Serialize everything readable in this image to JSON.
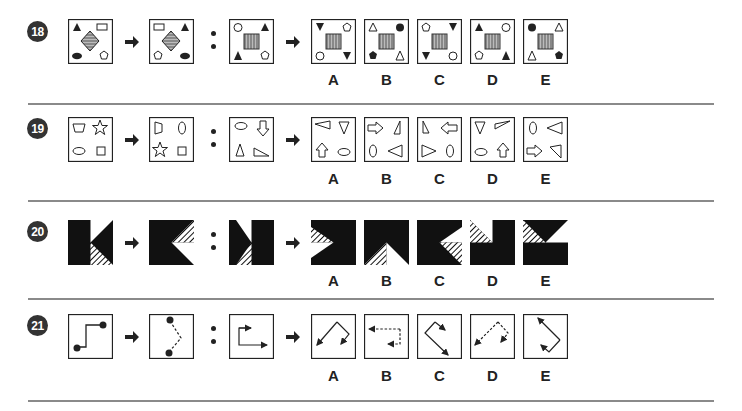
{
  "questions": [
    {
      "number": "18",
      "stimulus": [
        "box-a",
        "box-b"
      ],
      "target": "box-c",
      "options": [
        {
          "label": "A"
        },
        {
          "label": "B"
        },
        {
          "label": "C"
        },
        {
          "label": "D"
        },
        {
          "label": "E"
        }
      ],
      "description": "Shapes around a hatched central figure rotate/reflect"
    },
    {
      "number": "19",
      "options": [
        {
          "label": "A"
        },
        {
          "label": "B"
        },
        {
          "label": "C"
        },
        {
          "label": "D"
        },
        {
          "label": "E"
        }
      ],
      "description": "Four outlined shapes rotate 90 degrees"
    },
    {
      "number": "20",
      "options": [
        {
          "label": "A"
        },
        {
          "label": "B"
        },
        {
          "label": "C"
        },
        {
          "label": "D"
        },
        {
          "label": "E"
        }
      ],
      "description": "Black squares with white and striped triangles"
    },
    {
      "number": "21",
      "options": [
        {
          "label": "A"
        },
        {
          "label": "B"
        },
        {
          "label": "C"
        },
        {
          "label": "D"
        },
        {
          "label": "E"
        }
      ],
      "description": "Line paths with endpoints / arrows rotate; solid becomes dashed"
    }
  ],
  "colors": {
    "ink": "#222222",
    "hatch": "#777777",
    "separator": "#8a8a8a",
    "badge": "#333333"
  }
}
